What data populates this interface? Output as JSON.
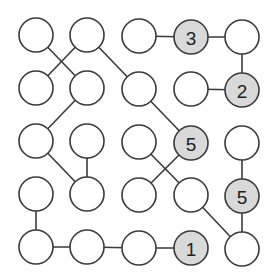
{
  "puzzle": {
    "type": "circle-connection-number-puzzle",
    "radius": 17,
    "colors": {
      "stroke": "#3a3a3a",
      "empty_fill": "#ffffff",
      "given_fill": "#d9d9d9",
      "number": "#222222"
    },
    "nodes": [
      {
        "id": "r1c1",
        "x": 36,
        "y": 35,
        "value": ""
      },
      {
        "id": "r1c2",
        "x": 87,
        "y": 35,
        "value": ""
      },
      {
        "id": "r1c3",
        "x": 139,
        "y": 36,
        "value": ""
      },
      {
        "id": "r1c4",
        "x": 191,
        "y": 37,
        "value": "3"
      },
      {
        "id": "r1c5",
        "x": 242,
        "y": 37,
        "value": ""
      },
      {
        "id": "r2c1",
        "x": 36,
        "y": 88,
        "value": ""
      },
      {
        "id": "r2c2",
        "x": 87,
        "y": 88,
        "value": ""
      },
      {
        "id": "r2c3",
        "x": 139,
        "y": 89,
        "value": ""
      },
      {
        "id": "r2c4",
        "x": 191,
        "y": 89,
        "value": ""
      },
      {
        "id": "r2c5",
        "x": 242,
        "y": 90,
        "value": "2"
      },
      {
        "id": "r3c1",
        "x": 36,
        "y": 141,
        "value": ""
      },
      {
        "id": "r3c2",
        "x": 87,
        "y": 141,
        "value": ""
      },
      {
        "id": "r3c3",
        "x": 139,
        "y": 142,
        "value": ""
      },
      {
        "id": "r3c4",
        "x": 191,
        "y": 143,
        "value": "5"
      },
      {
        "id": "r3c5",
        "x": 242,
        "y": 143,
        "value": ""
      },
      {
        "id": "r4c1",
        "x": 36,
        "y": 194,
        "value": ""
      },
      {
        "id": "r4c2",
        "x": 87,
        "y": 194,
        "value": ""
      },
      {
        "id": "r4c3",
        "x": 139,
        "y": 195,
        "value": ""
      },
      {
        "id": "r4c4",
        "x": 191,
        "y": 195,
        "value": ""
      },
      {
        "id": "r4c5",
        "x": 242,
        "y": 196,
        "value": "5"
      },
      {
        "id": "r5c1",
        "x": 36,
        "y": 247,
        "value": ""
      },
      {
        "id": "r5c2",
        "x": 87,
        "y": 247,
        "value": ""
      },
      {
        "id": "r5c3",
        "x": 139,
        "y": 248,
        "value": ""
      },
      {
        "id": "r5c4",
        "x": 191,
        "y": 248,
        "value": "1"
      },
      {
        "id": "r5c5",
        "x": 242,
        "y": 249,
        "value": ""
      }
    ],
    "edges": [
      [
        "r1c1",
        "r2c2"
      ],
      [
        "r1c2",
        "r2c1"
      ],
      [
        "r1c2",
        "r2c3"
      ],
      [
        "r1c3",
        "r1c4"
      ],
      [
        "r1c4",
        "r1c5"
      ],
      [
        "r1c5",
        "r2c5"
      ],
      [
        "r2c4",
        "r2c5"
      ],
      [
        "r2c2",
        "r3c1"
      ],
      [
        "r2c3",
        "r3c4"
      ],
      [
        "r3c1",
        "r4c2"
      ],
      [
        "r3c2",
        "r4c2"
      ],
      [
        "r3c3",
        "r4c4"
      ],
      [
        "r3c4",
        "r4c3"
      ],
      [
        "r3c5",
        "r4c5"
      ],
      [
        "r4c5",
        "r5c5"
      ],
      [
        "r4c4",
        "r5c5"
      ],
      [
        "r4c1",
        "r5c1"
      ],
      [
        "r5c1",
        "r5c2"
      ],
      [
        "r5c2",
        "r5c3"
      ],
      [
        "r5c3",
        "r5c4"
      ]
    ]
  }
}
